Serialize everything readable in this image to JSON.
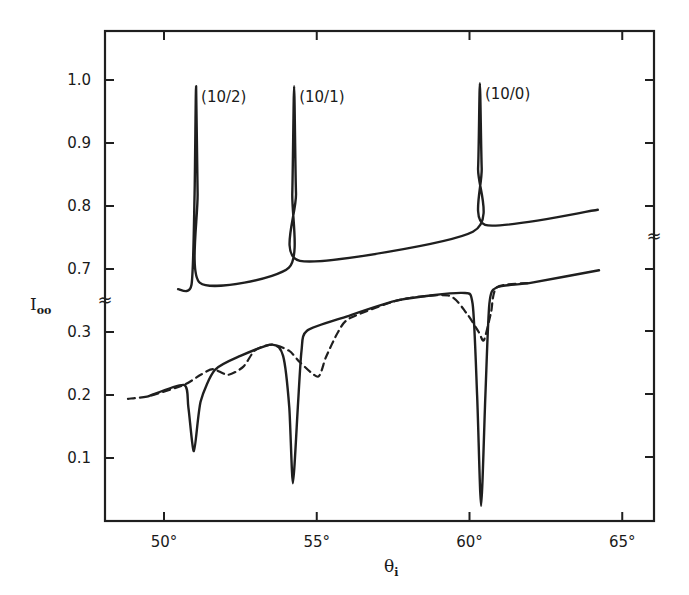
{
  "chart_data": {
    "type": "line",
    "title": "",
    "xlabel": "θ_i",
    "ylabel": "I_oo",
    "xlim": [
      48.0,
      66.0
    ],
    "x_ticks": [
      "50°",
      "55°",
      "60°",
      "65°"
    ],
    "x_tick_values": [
      50,
      55,
      60,
      65
    ],
    "y_ticks_upper": [
      "1.0",
      "0.9",
      "0.8",
      "0.7"
    ],
    "y_ticks_lower": [
      "0.3",
      "0.2",
      "0.1"
    ],
    "y_axis_broken": true,
    "axis_break_symbol": "≈",
    "grid": false,
    "legend": "none",
    "annotations": [
      {
        "text": "(10/2)",
        "x": 51.05,
        "y": 0.99
      },
      {
        "text": "(10/1)",
        "x": 54.26,
        "y": 0.99
      },
      {
        "text": "(10/0)",
        "x": 60.34,
        "y": 0.995
      }
    ],
    "series": [
      {
        "name": "upper (peaks, solid)",
        "style": "solid",
        "x": [
          50.46,
          50.9,
          51.0,
          51.05,
          51.1,
          51.18,
          54.09,
          54.2,
          54.26,
          54.32,
          54.45,
          60.11,
          60.28,
          60.34,
          60.4,
          60.51,
          64.2
        ],
        "y": [
          0.668,
          0.675,
          0.82,
          0.99,
          0.82,
          0.678,
          0.702,
          0.82,
          0.99,
          0.82,
          0.713,
          0.759,
          0.86,
          0.995,
          0.86,
          0.77,
          0.794
        ]
      },
      {
        "name": "lower (dips, solid)",
        "style": "solid",
        "x": [
          49.48,
          50.65,
          50.8,
          50.98,
          51.2,
          51.67,
          52.5,
          53.54,
          53.9,
          54.1,
          54.22,
          54.38,
          54.5,
          54.68,
          56.0,
          57.72,
          59.75,
          60.1,
          60.25,
          60.38,
          60.52,
          60.65,
          60.9,
          62.0,
          64.24
        ],
        "y": [
          0.198,
          0.216,
          0.18,
          0.111,
          0.19,
          0.24,
          0.262,
          0.28,
          0.262,
          0.18,
          0.06,
          0.18,
          0.27,
          0.302,
          0.325,
          0.351,
          0.362,
          0.345,
          0.2,
          0.024,
          0.2,
          0.345,
          0.371,
          0.378,
          0.398
        ]
      },
      {
        "name": "lower (dashed)",
        "style": "dashed",
        "x": [
          48.82,
          49.48,
          50.65,
          51.2,
          51.6,
          52.1,
          52.6,
          52.98,
          53.54,
          54.1,
          54.45,
          55.04,
          55.3,
          55.7,
          56.09,
          57.72,
          59.3,
          59.9,
          60.3,
          60.47,
          60.7,
          60.9,
          62.0
        ],
        "y": [
          0.194,
          0.198,
          0.216,
          0.232,
          0.241,
          0.232,
          0.245,
          0.271,
          0.28,
          0.27,
          0.252,
          0.229,
          0.26,
          0.3,
          0.322,
          0.351,
          0.358,
          0.33,
          0.3,
          0.287,
          0.33,
          0.371,
          0.378
        ]
      }
    ]
  },
  "layout": {
    "plot": {
      "left": 105,
      "top": 31,
      "right": 654,
      "bottom": 521
    },
    "x_px_per_deg": 30.55,
    "x_origin_deg": 50,
    "x_origin_px": 164,
    "upper_ref": {
      "value": 1.0,
      "px": 80
    },
    "lower_ref": {
      "value": 0.3,
      "px": 332
    },
    "px_per_unit": 630,
    "left_break_y": 300,
    "right_break_y": 236
  }
}
